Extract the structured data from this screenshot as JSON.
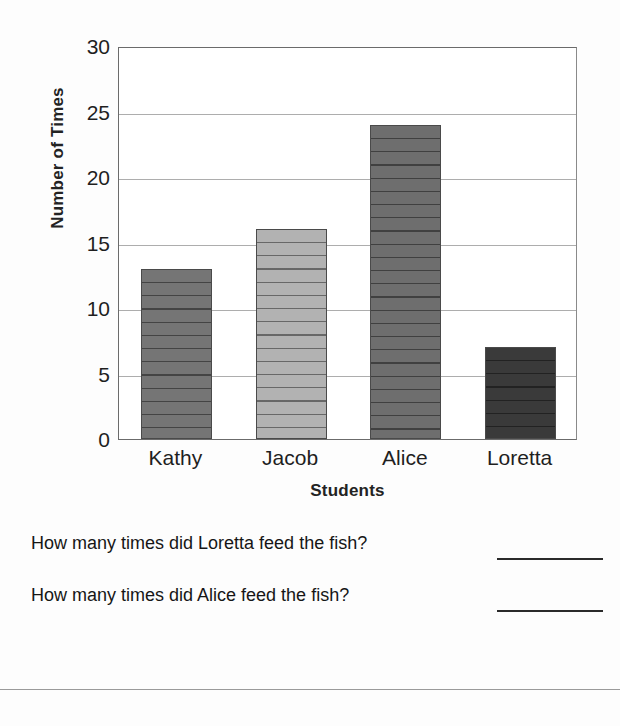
{
  "chart_data": {
    "type": "bar",
    "title": "",
    "categories": [
      "Kathy",
      "Jacob",
      "Alice",
      "Loretta"
    ],
    "values": [
      13,
      16,
      24,
      7
    ],
    "xlabel": "Students",
    "ylabel": "Number of Times",
    "ylim": [
      0,
      30
    ],
    "yticks": [
      0,
      5,
      10,
      15,
      20,
      25,
      30
    ],
    "ytick_labels": [
      "0",
      "5",
      "10",
      "15",
      "20",
      "25",
      "30"
    ],
    "grid": true,
    "legend": "none",
    "bar_colors": [
      "#757575",
      "#b2b2b2",
      "#6e6e6e",
      "#3a3a3a"
    ],
    "bar_edge_color": "#4a4a4a",
    "gridline_color": "#adadad",
    "axis_color": "#6b6b6b",
    "hatch": "horizontal-lines"
  },
  "questions": [
    {
      "text": "How many times did Loretta feed the fish?",
      "answer": ""
    },
    {
      "text": "How many times did Alice feed the fish?",
      "answer": ""
    }
  ]
}
